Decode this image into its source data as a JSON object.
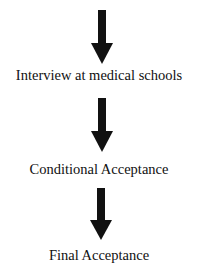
{
  "diagram": {
    "type": "flowchart",
    "direction": "top-to-bottom",
    "colors": {
      "arrow": "#111111",
      "text": "#111111",
      "background": "#ffffff"
    },
    "steps": [
      {
        "label": "Interview at medical schools"
      },
      {
        "label": "Conditional Acceptance"
      },
      {
        "label": "Final Acceptance"
      }
    ],
    "arrows": [
      {
        "icon": "down-arrow-icon",
        "to": "Interview at medical schools"
      },
      {
        "icon": "down-arrow-icon",
        "to": "Conditional Acceptance"
      },
      {
        "icon": "down-arrow-icon",
        "to": "Final Acceptance"
      }
    ]
  }
}
